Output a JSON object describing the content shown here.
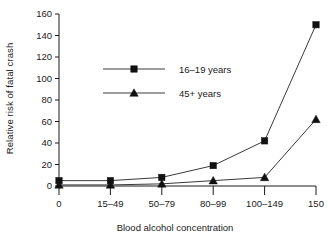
{
  "chart_data": {
    "type": "line",
    "title": "",
    "xlabel": "Blood alcohol concentration",
    "ylabel": "Relative risk of fatal crash",
    "categories": [
      "0",
      "15–49",
      "50–79",
      "80–99",
      "100–149",
      "150"
    ],
    "yticks": [
      0,
      20,
      40,
      60,
      80,
      100,
      120,
      140,
      160
    ],
    "ylim": [
      0,
      160
    ],
    "grid": false,
    "legend_position": "inside-upper-left",
    "series": [
      {
        "name": "16–19 years",
        "marker": "square",
        "values": [
          5,
          5,
          8,
          19,
          42,
          150
        ]
      },
      {
        "name": "45+ years",
        "marker": "triangle",
        "values": [
          1,
          1,
          2,
          5,
          8,
          62
        ]
      }
    ]
  },
  "axes": {
    "y_tick_labels": [
      "160",
      "140",
      "120",
      "100",
      "80",
      "60",
      "40",
      "20",
      "0"
    ],
    "x_tick_labels": [
      "0",
      "15–49",
      "50–79",
      "80–99",
      "100–149",
      "150"
    ],
    "y_axis_title": "Relative risk of fatal crash",
    "x_axis_title": "Blood alcohol concentration"
  },
  "legend": {
    "entries": [
      {
        "label": "16–19 years",
        "marker": "square-marker"
      },
      {
        "label": "45+ years",
        "marker": "triangle-marker"
      }
    ]
  },
  "colors": {
    "line": "#3a3a3a",
    "marker": "#111111",
    "axis": "#1a1a1a",
    "background": "#ffffff",
    "text": "#1a1a1a"
  }
}
